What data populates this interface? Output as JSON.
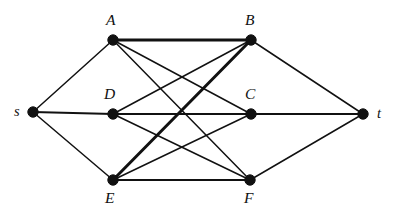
{
  "figure": {
    "type": "undirected-graph-diagram",
    "background_color": "#ffffff",
    "ink_color": "#111111",
    "width": 395,
    "height": 221
  },
  "nodes": [
    {
      "id": "s",
      "label": "s",
      "x": 33,
      "y": 112,
      "label_x": 14,
      "label_y": 104,
      "label_size": "lower"
    },
    {
      "id": "A",
      "label": "A",
      "x": 113,
      "y": 40,
      "label_x": 106,
      "label_y": 12,
      "label_size": "upper"
    },
    {
      "id": "B",
      "label": "B",
      "x": 251,
      "y": 40,
      "label_x": 245,
      "label_y": 12,
      "label_size": "upper"
    },
    {
      "id": "D",
      "label": "D",
      "x": 113,
      "y": 114,
      "label_x": 104,
      "label_y": 86,
      "label_size": "upper"
    },
    {
      "id": "C",
      "label": "C",
      "x": 251,
      "y": 114,
      "label_x": 245,
      "label_y": 86,
      "label_size": "upper"
    },
    {
      "id": "E",
      "label": "E",
      "x": 113,
      "y": 180,
      "label_x": 105,
      "label_y": 190,
      "label_size": "upper"
    },
    {
      "id": "F",
      "label": "F",
      "x": 250,
      "y": 180,
      "label_x": 244,
      "label_y": 190,
      "label_size": "upper"
    },
    {
      "id": "t",
      "label": "t",
      "x": 363,
      "y": 114,
      "label_x": 377,
      "label_y": 106,
      "label_size": "lower"
    }
  ],
  "node_radius": 5.2,
  "edges": [
    {
      "from": "s",
      "to": "A",
      "weight": "thin"
    },
    {
      "from": "s",
      "to": "D",
      "weight": "medium"
    },
    {
      "from": "s",
      "to": "E",
      "weight": "thin"
    },
    {
      "from": "A",
      "to": "B",
      "weight": "thick"
    },
    {
      "from": "A",
      "to": "C",
      "weight": "thin"
    },
    {
      "from": "A",
      "to": "F",
      "weight": "thin"
    },
    {
      "from": "B",
      "to": "D",
      "weight": "thin"
    },
    {
      "from": "B",
      "to": "E",
      "weight": "thick"
    },
    {
      "from": "D",
      "to": "C",
      "weight": "medium"
    },
    {
      "from": "D",
      "to": "F",
      "weight": "thin"
    },
    {
      "from": "E",
      "to": "C",
      "weight": "thin"
    },
    {
      "from": "E",
      "to": "F",
      "weight": "medium"
    },
    {
      "from": "B",
      "to": "t",
      "weight": "thin"
    },
    {
      "from": "C",
      "to": "t",
      "weight": "medium"
    },
    {
      "from": "F",
      "to": "t",
      "weight": "thin"
    }
  ]
}
